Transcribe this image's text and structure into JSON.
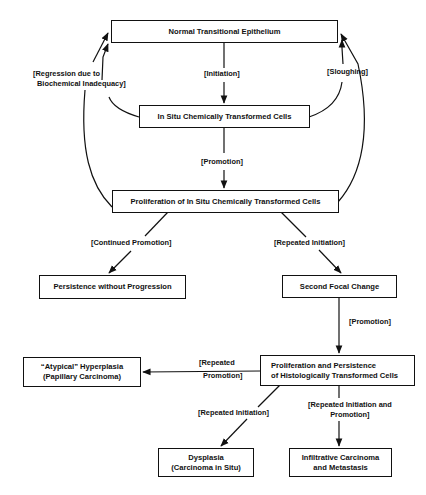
{
  "diagram": {
    "nodes": {
      "normal": "Normal Transitional Epithelium",
      "in_situ": "In Situ Chemically Transformed Cells",
      "proliferation_in_situ": "Proliferation of In Situ Chemically Transformed Cells",
      "persistence": "Persistence without Progression",
      "second_focal": "Second Focal Change",
      "prolif_hist_line1": "Proliferation and Persistence",
      "prolif_hist_line2": "of Histologically Transformed Cells",
      "atypical_line1": "“Atypical” Hyperplasia",
      "atypical_line2": "(Papillary Carcinoma)",
      "dysplasia_line1": "Dysplasia",
      "dysplasia_line2": "(Carcinoma in Situ)",
      "infiltrative_line1": "Infiltrative Carcinoma",
      "infiltrative_line2": "and Metastasis"
    },
    "edges": {
      "initiation": "[Initiation]",
      "promotion_1": "[Promotion]",
      "regression_line1": "[Regression due to",
      "regression_line2": "Biochemical Inadequacy]",
      "sloughing": "[Sloughing]",
      "continued_promotion": "[Continued Promotion]",
      "repeated_initiation_1": "[Repeated Initiation]",
      "promotion_2": "[Promotion]",
      "repeated_promotion_line1": "[Repeated",
      "repeated_promotion_line2": "Promotion]",
      "repeated_initiation_2": "[Repeated Initiation]",
      "rep_init_promo_line1": "[Repeated Initiation and",
      "rep_init_promo_line2": "Promotion]"
    }
  }
}
